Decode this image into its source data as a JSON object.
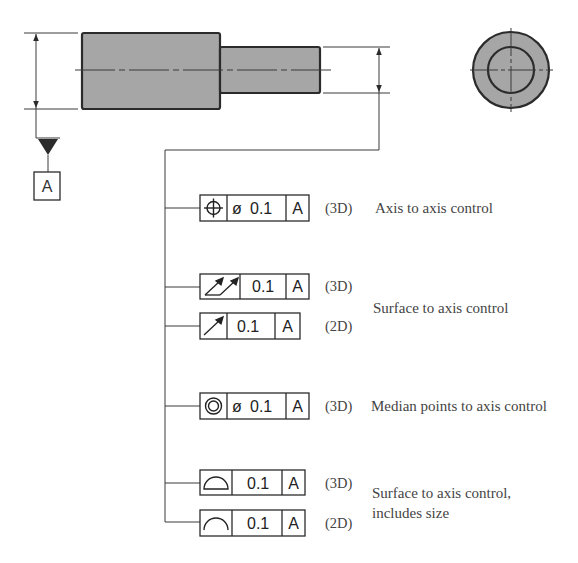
{
  "diagram": {
    "colors": {
      "part_fill": "#a6a6a6",
      "line": "#2b2b2b",
      "text": "#444444"
    },
    "datum": {
      "label": "A"
    },
    "frames": [
      {
        "symbol": "position-icon",
        "tolerance": "0.1",
        "diameter": "ø",
        "datum": "A",
        "tag": "(3D)"
      },
      {
        "symbol": "total-runout-icon",
        "tolerance": "0.1",
        "diameter": "",
        "datum": "A",
        "tag": "(3D)"
      },
      {
        "symbol": "circular-runout-icon",
        "tolerance": "0.1",
        "diameter": "",
        "datum": "A",
        "tag": "(2D)"
      },
      {
        "symbol": "concentricity-icon",
        "tolerance": "0.1",
        "diameter": "ø",
        "datum": "A",
        "tag": "(3D)"
      },
      {
        "symbol": "profile-of-surface-icon",
        "tolerance": "0.1",
        "diameter": "",
        "datum": "A",
        "tag": "(3D)"
      },
      {
        "symbol": "profile-of-line-icon",
        "tolerance": "0.1",
        "diameter": "",
        "datum": "A",
        "tag": "(2D)"
      }
    ],
    "descriptions": {
      "d1": "Axis to axis control",
      "d2": "Surface to axis control",
      "d3": "Median points to axis control",
      "d4_line1": "Surface to axis control,",
      "d4_line2": "includes size"
    }
  }
}
